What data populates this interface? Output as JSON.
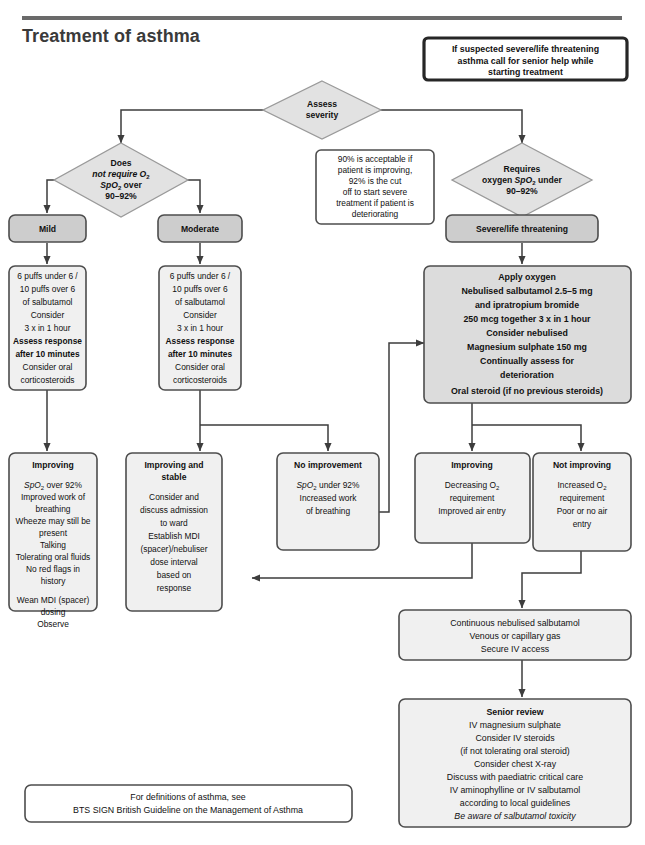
{
  "page": {
    "title": "Treatment of asthma"
  },
  "colors": {
    "box_fill": "#f0f0f0",
    "shaded_fill": "#cdcdcd",
    "severe_fill": "#dcdcdc",
    "diamond_fill": "#e2e2e2",
    "stroke": "#4d4d4d",
    "heavy_stroke": "#262626",
    "title": "#3a3a3a",
    "rule": "#6a6a6a"
  },
  "alert_note": {
    "lines": [
      "If suspected severe/life threatening",
      "asthma call for senior help while",
      "starting treatment"
    ]
  },
  "assess": {
    "lines": [
      "Assess",
      "severity"
    ]
  },
  "left_branch": {
    "diamond": {
      "lines": [
        "Does",
        "not require O₂",
        "SpO₂ over",
        "90–92%"
      ]
    },
    "mild_label": "Mild",
    "moderate_label": "Moderate"
  },
  "right_branch": {
    "diamond": {
      "lines": [
        "Requires",
        "oxygen SpO₂ under",
        "90–92%"
      ]
    },
    "severe_label": "Severe/life threatening"
  },
  "side_note": {
    "lines": [
      "90% is acceptable if",
      "patient is improving,",
      "92% is the cut",
      "off to start severe",
      "treatment if patient is",
      "deteriorating"
    ]
  },
  "mild_treatment": {
    "lines": [
      {
        "t": "6 puffs under 6 /",
        "b": false
      },
      {
        "t": "10 puffs over 6",
        "b": false
      },
      {
        "t": "of salbutamol",
        "b": false
      },
      {
        "t": "Consider",
        "b": false
      },
      {
        "t": "3 x in 1 hour",
        "b": false
      },
      {
        "t": "Assess response",
        "b": true
      },
      {
        "t": "after 10 minutes",
        "b": true
      },
      {
        "t": "Consider oral",
        "b": false
      },
      {
        "t": "corticosteroids",
        "b": false
      }
    ]
  },
  "moderate_treatment": {
    "lines": [
      {
        "t": "6 puffs under 6 /",
        "b": false
      },
      {
        "t": "10 puffs over 6",
        "b": false
      },
      {
        "t": "of salbutamol",
        "b": false
      },
      {
        "t": "Consider",
        "b": false
      },
      {
        "t": "3 x in 1 hour",
        "b": false
      },
      {
        "t": "Assess response",
        "b": true
      },
      {
        "t": "after 10 minutes",
        "b": true
      },
      {
        "t": "Consider oral",
        "b": false
      },
      {
        "t": "corticosteroids",
        "b": false
      }
    ]
  },
  "severe_treatment": {
    "lines": [
      "Apply oxygen",
      "Nebulised salbutamol 2.5–5 mg",
      "and ipratropium bromide",
      "250 mcg together 3 x in 1 hour",
      "Consider nebulised",
      "Magnesium sulphate 150 mg",
      "Continually assess for",
      "deterioration",
      "Oral steroid (if no previous steroids)"
    ]
  },
  "outcome_improving_left": {
    "heading": "Improving",
    "lines": [
      "SpO₂ over 92%",
      "Improved work of",
      "breathing",
      "Wheeze may still be",
      "present",
      "Talking",
      "Tolerating oral fluids",
      "No red flags in",
      "history",
      "",
      "Wean MDI (spacer)",
      "dosing",
      "Observe"
    ]
  },
  "outcome_improving_stable": {
    "heading_lines": [
      "Improving and",
      "stable"
    ],
    "lines": [
      "Consider and",
      "discuss admission",
      "to ward",
      "Establish MDI",
      "(spacer)/nebuliser",
      "dose interval",
      "based on",
      "response"
    ]
  },
  "outcome_no_improvement": {
    "heading": "No improvement",
    "lines": [
      "SpO₂ under 92%",
      "Increased work",
      "of breathing"
    ]
  },
  "outcome_improving_right": {
    "heading": "Improving",
    "lines": [
      "Decreasing O₂",
      "requirement",
      "Improved air entry"
    ]
  },
  "outcome_not_improving": {
    "heading": "Not improving",
    "lines": [
      "Increased O₂",
      "requirement",
      "Poor or no air",
      "entry"
    ]
  },
  "continuous_box": {
    "lines": [
      "Continuous nebulised salbutamol",
      "Venous or capillary gas",
      "Secure IV access"
    ]
  },
  "senior_review": {
    "heading": "Senior review",
    "lines": [
      {
        "t": "IV magnesium sulphate",
        "i": false
      },
      {
        "t": "Consider IV steroids",
        "i": false
      },
      {
        "t": "(if not tolerating oral steroid)",
        "i": false
      },
      {
        "t": "Consider chest X-ray",
        "i": false
      },
      {
        "t": "Discuss with paediatric critical care",
        "i": false
      },
      {
        "t": "IV aminophylline or IV salbutamol",
        "i": false
      },
      {
        "t": "according to local guidelines",
        "i": false
      },
      {
        "t": "(consider ondansetron)",
        "i": false
      },
      {
        "t": "Be aware of salbutamol toxicity",
        "i": true
      }
    ]
  },
  "definitions_box": {
    "lines": [
      "For definitions of asthma, see",
      "BTS SIGN British Guideline on the Management of Asthma"
    ]
  }
}
